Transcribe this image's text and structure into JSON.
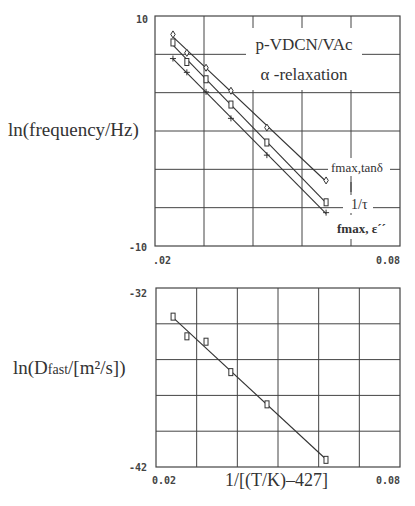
{
  "chart_data": [
    {
      "type": "scatter",
      "title": "p-VDCN/VAc α -relaxation",
      "annotation_lines": [
        "p-VDCN/VAc",
        "α -relaxation"
      ],
      "xlabel": "",
      "ylabel": "ln(frequency/Hz)",
      "xlim": [
        0.02,
        0.08
      ],
      "ylim": [
        -10,
        10
      ],
      "xtick_labels": [
        ".02",
        "0.08"
      ],
      "ytick_labels": [
        "10",
        "-10"
      ],
      "grid": true,
      "grid_cols": 5,
      "grid_rows": 6,
      "fit_lines": true,
      "x": [
        0.0244,
        0.0278,
        0.0325,
        0.0386,
        0.0474,
        0.0619
      ],
      "series": [
        {
          "name": "fmax,tanδ",
          "marker": "diamond",
          "values": [
            8.4,
            6.8,
            5.5,
            3.5,
            0.3,
            -4.3
          ]
        },
        {
          "name": "1/τ",
          "marker": "square",
          "values": [
            7.7,
            6.0,
            4.5,
            2.3,
            -1.0,
            -6.2
          ]
        },
        {
          "name": "fmax, ε´´",
          "marker": "plus",
          "values": [
            6.3,
            5.1,
            3.4,
            1.1,
            -2.1,
            -7.1
          ]
        }
      ],
      "legend": "inline labels at right end of lines"
    },
    {
      "type": "scatter",
      "title": "",
      "xlabel": "1/[(T/K)–427]",
      "ylabel": "ln(Dfast/[m²/s])",
      "xlim": [
        0.02,
        0.08
      ],
      "ylim": [
        -42,
        -32
      ],
      "xtick_labels": [
        "0.02",
        "0.08"
      ],
      "ytick_labels": [
        "-32",
        "-42"
      ],
      "grid": true,
      "grid_cols": 6,
      "grid_rows": 5,
      "fit_lines": true,
      "x": [
        0.0242,
        0.0276,
        0.0323,
        0.0384,
        0.0473,
        0.0618
      ],
      "series": [
        {
          "name": "Dfast",
          "marker": "square",
          "values": [
            -33.6,
            -34.7,
            -35.0,
            -36.7,
            -38.5,
            -41.6
          ]
        }
      ]
    }
  ],
  "labels": {
    "top_ylabel": "ln(frequency/Hz)",
    "bottom_ylabel_pre": "ln(D",
    "bottom_ylabel_sub": "fast",
    "bottom_ylabel_post": "/[m²/s])",
    "top_xtick_left": ".02",
    "top_xtick_right": "0.08",
    "top_ytick_top": "10",
    "top_ytick_bottom": "-10",
    "bottom_xtick_left": "0.02",
    "bottom_xtick_right": "0.08",
    "bottom_ytick_top": "-32",
    "bottom_ytick_bottom": "-42",
    "bottom_xlabel": "1/[(T/K)–427]",
    "legend_tand": "fmax,tanδ",
    "legend_tau": "1/τ",
    "legend_eps": "fmax, ε´´"
  },
  "colors": {
    "line": "#333333",
    "grid": "#444444",
    "background": "#ffffff"
  }
}
